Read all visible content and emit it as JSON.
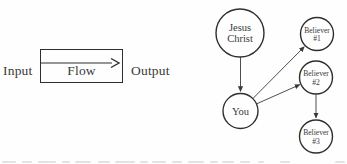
{
  "flow_diagram": {
    "input_label": "Input",
    "box_label": "Flow",
    "output_label": "Output"
  },
  "network_diagram": {
    "nodes": [
      {
        "id": "jesus-christ",
        "line1": "Jesus",
        "line2": "Christ"
      },
      {
        "id": "believer-1",
        "line1": "Believer",
        "line2": "#1"
      },
      {
        "id": "believer-2",
        "line1": "Believer",
        "line2": "#2"
      },
      {
        "id": "you",
        "line1": "You"
      },
      {
        "id": "believer-3",
        "line1": "Believer",
        "line2": "#3"
      }
    ],
    "edges": [
      {
        "from": "jesus-christ",
        "to": "you"
      },
      {
        "from": "you",
        "to": "believer-1"
      },
      {
        "from": "you",
        "to": "believer-2"
      },
      {
        "from": "believer-2",
        "to": "believer-3"
      }
    ]
  },
  "colors": {
    "ink": "#2e2e2e",
    "text": "#3a3a3a",
    "background": "#fefefe"
  }
}
